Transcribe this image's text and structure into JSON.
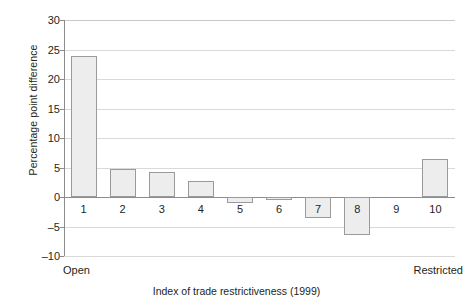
{
  "chart_data": {
    "type": "bar",
    "title": "",
    "subtitle": "",
    "xlabel": "Index of trade restrictiveness (1999)",
    "ylabel": "Percentage point difference",
    "categories": [
      "1",
      "2",
      "3",
      "4",
      "5",
      "6",
      "7",
      "8",
      "9",
      "10"
    ],
    "values": [
      23.9,
      4.8,
      4.3,
      2.7,
      -1.0,
      -0.5,
      -3.5,
      -6.5,
      0.0,
      6.4
    ],
    "ylim": [
      -10,
      30
    ],
    "yticks": [
      30,
      25,
      20,
      15,
      10,
      5,
      0,
      -5,
      -10
    ],
    "ytick_labels": [
      "30",
      "25",
      "20",
      "15",
      "10",
      "5",
      "0",
      "–5",
      "–10"
    ],
    "grid": true,
    "legend": "none",
    "axis_annotations": {
      "x_left": "Open",
      "x_right": "Restricted"
    },
    "colors": {
      "bar_fill": "#ededed",
      "bar_border": "#9a9a9a",
      "gridline": "#d9d9d9",
      "axis": "#8c8c8c",
      "text": "#231f20",
      "background": "#ffffff"
    }
  }
}
